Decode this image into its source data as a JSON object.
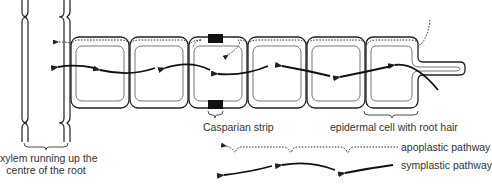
{
  "diagram": {
    "colors": {
      "stroke": "#222222",
      "inner": "#555555",
      "strip": "#111111",
      "text": "#333333"
    }
  },
  "labels": {
    "casparian_strip": "Casparian strip",
    "epidermal_cell": "epidermal cell with root hair",
    "xylem_line1": "xylem running up the",
    "xylem_line2": "centre of the root"
  },
  "legend": {
    "apoplastic": {
      "label": "apoplastic pathway",
      "style": "dotted"
    },
    "symplastic": {
      "label": "symplastic pathway",
      "style": "solid"
    }
  },
  "cells": {
    "count": 6,
    "root_hair_cell_index": 5,
    "casparian_cell_index": 2
  }
}
